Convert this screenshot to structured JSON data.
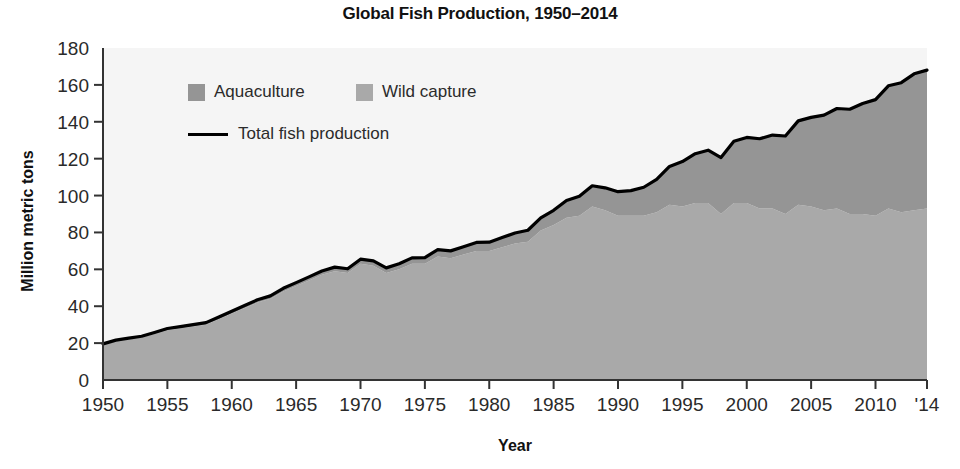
{
  "chart_data": {
    "type": "area",
    "title": "Global Fish Production, 1950–2014",
    "xlabel": "Year",
    "ylabel": "Million metric tons",
    "xlim": [
      1950,
      2014
    ],
    "ylim": [
      0,
      180
    ],
    "grid": false,
    "legend_position": "upper-left-inside",
    "stacked": true,
    "x": [
      1950,
      1951,
      1952,
      1953,
      1954,
      1955,
      1956,
      1957,
      1958,
      1959,
      1960,
      1961,
      1962,
      1963,
      1964,
      1965,
      1966,
      1967,
      1968,
      1969,
      1970,
      1971,
      1972,
      1973,
      1974,
      1975,
      1976,
      1977,
      1978,
      1979,
      1980,
      1981,
      1982,
      1983,
      1984,
      1985,
      1986,
      1987,
      1988,
      1989,
      1990,
      1991,
      1992,
      1993,
      1994,
      1995,
      1996,
      1997,
      1998,
      1999,
      2000,
      2001,
      2002,
      2003,
      2004,
      2005,
      2006,
      2007,
      2008,
      2009,
      2010,
      2011,
      2012,
      2013,
      2014
    ],
    "series": [
      {
        "name": "Wild capture",
        "color": "#a9a9a9",
        "values": [
          19,
          21,
          22,
          23,
          25,
          27,
          28,
          29,
          30,
          33,
          36,
          39,
          42,
          44,
          48,
          51,
          54,
          57,
          59,
          58,
          63,
          62,
          58,
          60,
          63,
          63,
          67,
          66,
          68,
          70,
          70,
          72,
          74,
          75,
          81,
          84,
          88,
          89,
          94,
          92,
          89,
          89,
          89,
          91,
          95,
          94,
          96,
          96,
          90,
          96,
          96,
          93,
          93,
          90,
          95,
          94,
          92,
          93,
          90,
          90,
          89,
          93,
          91,
          92,
          93
        ]
      },
      {
        "name": "Aquaculture",
        "color": "#959595",
        "values": [
          0.6,
          0.6,
          0.7,
          0.7,
          0.8,
          0.9,
          0.9,
          1.0,
          1.1,
          1.2,
          1.3,
          1.4,
          1.5,
          1.6,
          1.7,
          1.8,
          1.9,
          2.1,
          2.2,
          2.3,
          2.5,
          2.6,
          2.8,
          3.0,
          3.2,
          3.4,
          3.7,
          4.0,
          4.3,
          4.6,
          4.7,
          5.2,
          5.7,
          6.2,
          6.9,
          8.0,
          9.3,
          10.6,
          11.3,
          12.2,
          13.1,
          13.7,
          15.5,
          17.8,
          20.8,
          24.4,
          26.7,
          28.6,
          30.6,
          33.4,
          35.5,
          37.8,
          39.8,
          42.3,
          45.5,
          48.4,
          51.6,
          54.2,
          56.8,
          59.9,
          63.0,
          66.5,
          70.2,
          74.0,
          75.0
        ]
      }
    ],
    "total_line": {
      "name": "Total fish production",
      "color": "#000000",
      "values": [
        19.6,
        21.6,
        22.7,
        23.7,
        25.8,
        27.9,
        28.9,
        30.0,
        31.1,
        34.2,
        37.3,
        40.4,
        43.5,
        45.6,
        49.7,
        52.8,
        55.9,
        59.1,
        61.2,
        60.3,
        65.5,
        64.6,
        60.8,
        63.0,
        66.2,
        66.4,
        70.7,
        70.0,
        72.3,
        74.6,
        74.7,
        77.2,
        79.7,
        81.2,
        87.9,
        92.0,
        97.3,
        99.6,
        105.3,
        104.2,
        102.1,
        102.7,
        104.5,
        108.8,
        115.8,
        118.4,
        122.7,
        124.6,
        120.6,
        129.4,
        131.5,
        130.8,
        132.8,
        132.3,
        140.5,
        142.4,
        143.6,
        147.2,
        146.8,
        149.9,
        152.0,
        159.5,
        161.2,
        166.0,
        168.0
      ]
    },
    "yticks": [
      0,
      20,
      40,
      60,
      80,
      100,
      120,
      140,
      160,
      180
    ],
    "xticks": [
      1950,
      1955,
      1960,
      1965,
      1970,
      1975,
      1980,
      1985,
      1990,
      1995,
      2000,
      2005,
      2010,
      2014
    ],
    "xtick_labels": [
      "1950",
      "1955",
      "1960",
      "1965",
      "1970",
      "1975",
      "1980",
      "1985",
      "1990",
      "1995",
      "2000",
      "2005",
      "2010",
      "'14"
    ],
    "ytick_labels": [
      "0",
      "20",
      "40",
      "60",
      "80",
      "100",
      "120",
      "140",
      "160",
      "180"
    ],
    "plot_background": "#f5f5f5",
    "axis_color": "#333333"
  },
  "legend": {
    "aquaculture_label": "Aquaculture",
    "wild_capture_label": "Wild capture",
    "total_label": "Total fish production",
    "aquaculture_color": "#959595",
    "wild_capture_color": "#a9a9a9",
    "total_color": "#000000"
  }
}
